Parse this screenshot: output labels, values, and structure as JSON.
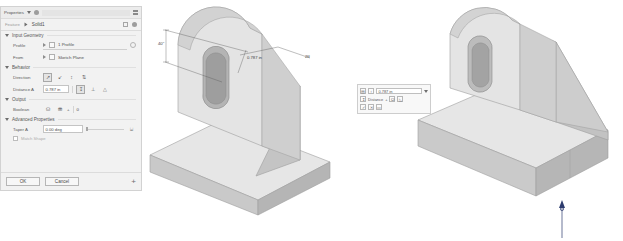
{
  "panel": {
    "title": "Properties",
    "title_menu_icon": "chevron-down-icon",
    "pin_icon": "pin-icon",
    "grip_icon": "grip-icon",
    "breadcrumb_parent": "Feature",
    "breadcrumb_current": "Solid1",
    "groups": {
      "input_geometry": {
        "label": "Input Geometry",
        "profile": {
          "label": "Profile",
          "value": "1 Profile",
          "end_icon": "target-icon"
        },
        "from": {
          "label": "From",
          "value": "Sketch Plane"
        }
      },
      "behavior": {
        "label": "Behavior",
        "direction": {
          "label": "Direction",
          "options": [
            "direction-default-icon",
            "direction-flip-icon",
            "direction-symmetric-icon",
            "direction-asymmetric-icon"
          ],
          "selected_index": 0
        },
        "distance": {
          "label": "Distance A",
          "value": "0.787 in",
          "extent_options": [
            "extent-distance-icon",
            "extent-to-next-icon",
            "extent-to-icon"
          ],
          "selected_index": 0
        }
      },
      "output": {
        "label": "Output",
        "boolean": {
          "label": "Boolean",
          "options": [
            "boolean-join-icon",
            "boolean-cut-icon"
          ],
          "selected_index": 0,
          "operator": "+",
          "result": "0"
        }
      },
      "advanced": {
        "label": "Advanced Properties",
        "taper": {
          "label": "Taper A",
          "value": "0.00 deg",
          "slider_percent": 0,
          "measure_icon": "measure-icon"
        },
        "match_shape": {
          "label": "Match Shape",
          "checked": false
        }
      }
    },
    "footer": {
      "ok": "OK",
      "cancel": "Cancel",
      "add_icon": "plus-icon"
    }
  },
  "mini_toolbar": {
    "row1": {
      "icon_a": "extrude-icon",
      "icon_b": "direction-icon",
      "value": "0.787 in",
      "dropdown_icon": "chevron-down-icon"
    },
    "row2": {
      "label": "Distance",
      "operator": "+",
      "icon_a": "boolean-join-icon",
      "icon_b": "taper-icon"
    },
    "row3": {
      "ok_icon": "check-icon",
      "cancel_icon": "close-icon",
      "more_icon": "more-icon"
    }
  },
  "viewport_middle": {
    "annotations": [
      {
        "name": "slot-height-dimension",
        "text": "40\""
      },
      {
        "name": "slot-width-dimension",
        "text": "0.787 in"
      },
      {
        "name": "leader-callout",
        "text": "2ff"
      }
    ]
  },
  "viewport_right": {
    "manipulator": {
      "name": "extrude-direction-arrow",
      "color": "#2c3b6e"
    }
  },
  "colors": {
    "panel_bg": "#f2f2f2",
    "panel_border": "#d2d2d2",
    "text": "#4a4a4a",
    "model_light": "#e8e8e8",
    "model_mid": "#cccccc",
    "model_dark": "#b0b0b0",
    "background": "#ffffff"
  }
}
